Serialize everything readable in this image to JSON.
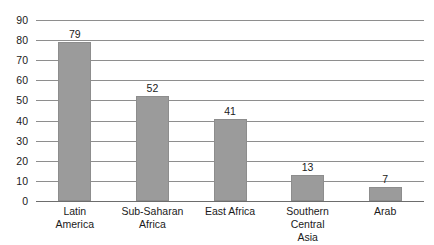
{
  "chart_data": {
    "type": "bar",
    "title": "",
    "subtitle": "",
    "xlabel": "",
    "ylabel": "",
    "categories": [
      "Latin America",
      "Sub-Saharan Africa",
      "East Africa",
      "Southern Central Asia",
      "Arab"
    ],
    "category_lines": [
      [
        "Latin",
        "America"
      ],
      [
        "Sub-Saharan",
        "Africa"
      ],
      [
        "East Africa",
        ""
      ],
      [
        "Southern Central",
        "Asia"
      ],
      [
        "Arab",
        ""
      ]
    ],
    "values": [
      79,
      52,
      41,
      13,
      7
    ],
    "value_labels": [
      "79",
      "52",
      "41",
      "13",
      "7"
    ],
    "ylim": [
      0,
      90
    ],
    "ytick_values": [
      0,
      10,
      20,
      30,
      40,
      50,
      60,
      70,
      80,
      90
    ],
    "ytick_labels": [
      "0",
      "10",
      "20",
      "30",
      "40",
      "50",
      "60",
      "70",
      "80",
      "90"
    ],
    "grid": true,
    "legend": false,
    "legend_position": "none",
    "bar_color": "#9b9b9b",
    "gridline_color": "#8e8e8e",
    "axis_color": "#6d6d6d",
    "text_color": "#1a1a1a",
    "background_color": "#ffffff"
  }
}
